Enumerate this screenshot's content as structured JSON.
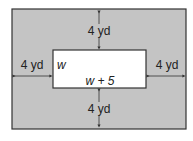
{
  "diagram": {
    "outer_fill": "#c4c4c4",
    "inner_fill": "#ffffff",
    "stroke": "#333333",
    "labels": {
      "top": "4 yd",
      "bottom": "4 yd",
      "left": "4 yd",
      "right": "4 yd",
      "width": "w",
      "length": "w + 5"
    }
  }
}
